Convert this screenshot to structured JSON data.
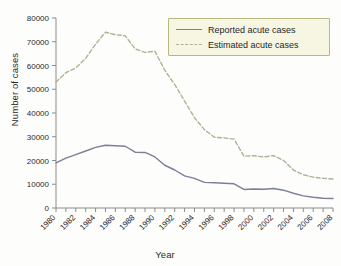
{
  "chart_data": {
    "type": "line",
    "title": "",
    "xlabel": "Year",
    "ylabel": "Number of cases",
    "xlim": [
      1980,
      2008
    ],
    "ylim": [
      0,
      80000
    ],
    "grid": false,
    "legend_position": "top-right",
    "x": [
      1980,
      1981,
      1982,
      1983,
      1984,
      1985,
      1986,
      1987,
      1988,
      1989,
      1990,
      1991,
      1992,
      1993,
      1994,
      1995,
      1996,
      1997,
      1998,
      1999,
      2000,
      2001,
      2002,
      2003,
      2004,
      2005,
      2006,
      2007,
      2008
    ],
    "xtick_labels": [
      "1980",
      "1982",
      "1984",
      "1986",
      "1988",
      "1990",
      "1992",
      "1994",
      "1996",
      "1998",
      "2000",
      "2002",
      "2004",
      "2006",
      "2008"
    ],
    "ytick_labels": [
      "0",
      "10000",
      "20000",
      "30000",
      "40000",
      "50000",
      "60000",
      "70000",
      "80000"
    ],
    "ytick_values": [
      0,
      10000,
      20000,
      30000,
      40000,
      50000,
      60000,
      70000,
      80000
    ],
    "series": [
      {
        "name": "Reported acute cases",
        "style": "solid",
        "color": "#7b7f99",
        "values": [
          19000,
          21000,
          22500,
          24000,
          25500,
          26400,
          26200,
          26000,
          23500,
          23400,
          21500,
          18000,
          16000,
          13500,
          12500,
          10800,
          10600,
          10400,
          10200,
          7800,
          8000,
          7900,
          8200,
          7500,
          6200,
          5100,
          4500,
          4100,
          4000
        ]
      },
      {
        "name": "Estimated acute cases",
        "style": "dashed",
        "color": "#b3b095",
        "values": [
          53000,
          57000,
          59000,
          63000,
          69000,
          74000,
          73000,
          72500,
          67000,
          65500,
          66000,
          58000,
          52000,
          45000,
          38000,
          33000,
          29800,
          29500,
          29000,
          21800,
          22000,
          21500,
          22100,
          20000,
          16000,
          14000,
          13000,
          12500,
          12200
        ]
      }
    ]
  },
  "legend": {
    "entries": [
      {
        "label": "Reported acute cases",
        "style": "solid",
        "color": "#7b7f99"
      },
      {
        "label": "Estimated acute cases",
        "style": "dashed",
        "color": "#b3b095"
      }
    ]
  },
  "axes": {
    "x_title": "Year",
    "y_title": "Number of cases"
  }
}
